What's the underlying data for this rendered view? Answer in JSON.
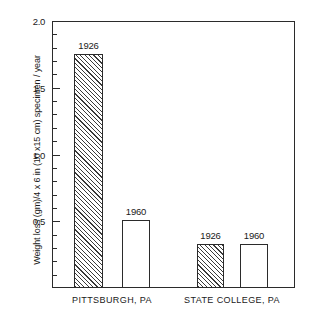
{
  "chart_data": {
    "type": "bar",
    "title": "",
    "xlabel": "",
    "ylabel": "Weight loss (gm)/4 x 6 in (10 x15 cm) specimen / year",
    "ylim": [
      0,
      2.0
    ],
    "grid": false,
    "legend": "none",
    "y_major_ticks": [
      "2.0",
      "1.5",
      "1.0",
      "0.5"
    ],
    "y_major_tick_values": [
      2.0,
      1.5,
      1.0,
      0.5
    ],
    "y_minor_tick_interval": 0.1,
    "groups": [
      "PITTSBURGH, PA",
      "STATE COLLEGE, PA"
    ],
    "categories": [
      "1926",
      "1960"
    ],
    "series": [
      {
        "name": "1926",
        "values": [
          1.75,
          0.33
        ],
        "fill": "hatched"
      },
      {
        "name": "1960",
        "values": [
          0.51,
          0.33
        ],
        "fill": "white"
      }
    ],
    "bars": [
      {
        "group": "PITTSBURGH, PA",
        "year": "1926",
        "value": 1.75,
        "fill": "hatched"
      },
      {
        "group": "PITTSBURGH, PA",
        "year": "1960",
        "value": 0.51,
        "fill": "white"
      },
      {
        "group": "STATE COLLEGE, PA",
        "year": "1926",
        "value": 0.33,
        "fill": "hatched"
      },
      {
        "group": "STATE COLLEGE, PA",
        "year": "1960",
        "value": 0.33,
        "fill": "white"
      }
    ]
  },
  "axis": {
    "tick_0": "2.0",
    "tick_1": "1.5",
    "tick_2": "1.0",
    "tick_3": "0.5",
    "y_title": "Weight loss (gm)/4 x 6 in (10 x15 cm) specimen / year"
  },
  "bar_labels": {
    "b0": "1926",
    "b1": "1960",
    "b2": "1926",
    "b3": "1960"
  },
  "group_labels": {
    "g0": "PITTSBURGH, PA",
    "g1": "STATE COLLEGE, PA"
  },
  "colors": {
    "axis": "#2b2b2b",
    "hatch": "#3a3a3a",
    "bar_fill": "#ffffff",
    "background": "#ffffff",
    "text": "#1a1a1a"
  }
}
